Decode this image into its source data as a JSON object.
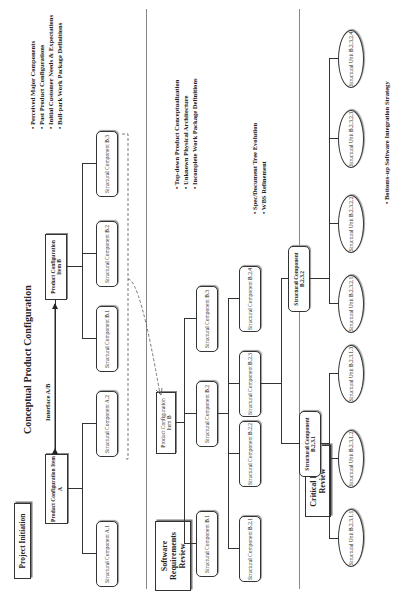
{
  "title": "Conceptual Product Configuration",
  "interface_label": "Interface A/B",
  "milestones": {
    "project_initiation": "Project Initiation",
    "software_requirements_review": "Software Requirements Review",
    "critical_design_review": "Critical Design Review"
  },
  "phase1": {
    "item_a": "Product Configuration Item A",
    "item_b": "Product Configuration Item B",
    "components": [
      "Structural Component A.1",
      "Structural Component A.2",
      "Structural Component B.1",
      "Structural Component B.2",
      "Structural Component B.3"
    ],
    "bullets": [
      "Perceived Major Components",
      "Past Product Configurations",
      "Initial Customer Needs & Expectations",
      "Ball-park Work Package Definitions"
    ]
  },
  "phase2": {
    "item_b": "Product Configuration Item B",
    "components": [
      "Structural Component B.1",
      "Structural Component B.2",
      "Structural Component B.3"
    ],
    "sub_components": [
      "Structural Component B.2.1",
      "Structural Component B.2.2",
      "Structural Component B.2.3",
      "Structural Component B.2.4"
    ],
    "bullets": [
      "Top-down Product Conceptualization",
      "Unknown Physical Architecture",
      "Incomplete Work Package Definitions"
    ]
  },
  "phase3": {
    "components": [
      "Structural Component B.2.3.1",
      "Structural Component B.2.3.2"
    ],
    "units": [
      "Structural Unit B.2.3.1.1",
      "Structural Unit B.2.3.1.2",
      "Structural Unit B.2.3.1.3",
      "Structural Unit B.2.3.2.1",
      "Structural Unit B.2.3.2.2",
      "Structural Unit B.2.3.2.3",
      "Structural Unit B.2.3.2.4"
    ],
    "bullets_mid": [
      "Spec/Document Tree Evolution",
      "WBS Refinement"
    ],
    "bullets_bottom": [
      "Bottoms-up Software Integration Strategy"
    ]
  }
}
